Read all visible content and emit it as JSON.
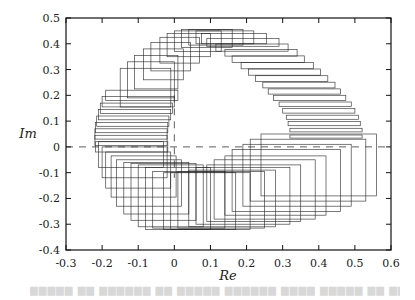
{
  "chart_data": {
    "type": "scatter",
    "subtype": "rectangle-enclosures",
    "title": "",
    "xlabel": "Re",
    "ylabel": "Im",
    "xlim": [
      -0.3,
      0.6
    ],
    "ylim": [
      -0.4,
      0.5
    ],
    "xticks": [
      "-0.3",
      "-0.2",
      "-0.1",
      "0",
      "0.1",
      "0.2",
      "0.3",
      "0.4",
      "0.5",
      "0.6"
    ],
    "yticks": [
      "-0.4",
      "-0.3",
      "-0.2",
      "-0.1",
      "0",
      "0.1",
      "0.2",
      "0.3",
      "0.4",
      "0.5"
    ],
    "grid": false,
    "legend": null,
    "reference_lines": [
      {
        "orientation": "horizontal",
        "value": 0,
        "style": "dashed",
        "from": -0.3,
        "to": 0.6
      },
      {
        "orientation": "vertical",
        "value": 0,
        "style": "dashed",
        "from": -0.12,
        "to": 0.2
      }
    ],
    "rectangles_spec": {
      "format": "[re_center, im_center, half_width, half_height]",
      "right_arc_thin": [
        [
          0.42,
          0.04,
          0.1,
          0.006
        ],
        [
          0.42,
          0.065,
          0.1,
          0.007
        ],
        [
          0.415,
          0.09,
          0.1,
          0.008
        ],
        [
          0.41,
          0.115,
          0.1,
          0.008
        ],
        [
          0.4,
          0.14,
          0.1,
          0.009
        ],
        [
          0.39,
          0.165,
          0.1,
          0.009
        ],
        [
          0.375,
          0.19,
          0.1,
          0.01
        ],
        [
          0.36,
          0.215,
          0.1,
          0.01
        ],
        [
          0.345,
          0.24,
          0.1,
          0.011
        ],
        [
          0.325,
          0.265,
          0.1,
          0.011
        ],
        [
          0.305,
          0.29,
          0.1,
          0.012
        ],
        [
          0.285,
          0.315,
          0.1,
          0.012
        ],
        [
          0.26,
          0.34,
          0.1,
          0.013
        ],
        [
          0.24,
          0.365,
          0.1,
          0.013
        ],
        [
          0.215,
          0.385,
          0.1,
          0.014
        ],
        [
          0.19,
          0.405,
          0.1,
          0.015
        ]
      ],
      "top_arc_mixed": [
        [
          0.165,
          0.42,
          0.09,
          0.02
        ],
        [
          0.14,
          0.425,
          0.08,
          0.025
        ],
        [
          0.115,
          0.425,
          0.075,
          0.03
        ],
        [
          0.09,
          0.42,
          0.07,
          0.035
        ],
        [
          0.065,
          0.41,
          0.065,
          0.04
        ],
        [
          0.04,
          0.395,
          0.06,
          0.045
        ],
        [
          0.015,
          0.375,
          0.055,
          0.05
        ],
        [
          -0.01,
          0.35,
          0.055,
          0.055
        ],
        [
          -0.03,
          0.32,
          0.055,
          0.06
        ],
        [
          -0.05,
          0.29,
          0.06,
          0.065
        ],
        [
          -0.065,
          0.26,
          0.065,
          0.07
        ],
        [
          -0.08,
          0.23,
          0.07,
          0.075
        ]
      ],
      "left_side_flat": [
        [
          -0.09,
          0.2,
          0.1,
          0.02
        ],
        [
          -0.1,
          0.175,
          0.1,
          0.02
        ],
        [
          -0.105,
          0.15,
          0.1,
          0.02
        ],
        [
          -0.11,
          0.125,
          0.1,
          0.02
        ],
        [
          -0.115,
          0.1,
          0.1,
          0.02
        ],
        [
          -0.118,
          0.075,
          0.1,
          0.02
        ],
        [
          -0.12,
          0.05,
          0.1,
          0.02
        ],
        [
          -0.12,
          0.025,
          0.1,
          0.02
        ],
        [
          -0.118,
          0.0,
          0.1,
          0.02
        ]
      ],
      "bottom_left_grid": [
        [
          -0.12,
          -0.03,
          0.09,
          0.05
        ],
        [
          -0.11,
          -0.06,
          0.09,
          0.06
        ],
        [
          -0.1,
          -0.09,
          0.09,
          0.07
        ],
        [
          -0.085,
          -0.115,
          0.09,
          0.08
        ],
        [
          -0.07,
          -0.14,
          0.09,
          0.09
        ],
        [
          -0.05,
          -0.16,
          0.09,
          0.1
        ],
        [
          -0.03,
          -0.175,
          0.09,
          0.11
        ],
        [
          -0.01,
          -0.19,
          0.09,
          0.12
        ],
        [
          0.01,
          -0.2,
          0.09,
          0.12
        ]
      ],
      "bottom_large": [
        [
          0.04,
          -0.205,
          0.1,
          0.11
        ],
        [
          0.07,
          -0.21,
          0.1,
          0.11
        ],
        [
          0.1,
          -0.21,
          0.11,
          0.11
        ],
        [
          0.13,
          -0.205,
          0.12,
          0.11
        ],
        [
          0.16,
          -0.2,
          0.12,
          0.11
        ],
        [
          0.19,
          -0.19,
          0.13,
          0.11
        ],
        [
          0.22,
          -0.18,
          0.13,
          0.11
        ],
        [
          0.25,
          -0.165,
          0.14,
          0.115
        ],
        [
          0.28,
          -0.15,
          0.14,
          0.115
        ],
        [
          0.31,
          -0.13,
          0.15,
          0.12
        ],
        [
          0.34,
          -0.11,
          0.15,
          0.12
        ],
        [
          0.37,
          -0.09,
          0.16,
          0.12
        ],
        [
          0.4,
          -0.07,
          0.16,
          0.12
        ]
      ]
    }
  },
  "caption_fragment": "Figure ... (faded, illegible caption text)"
}
